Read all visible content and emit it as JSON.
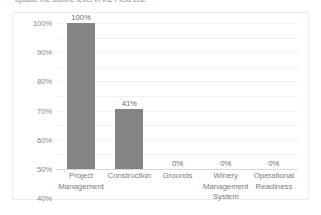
{
  "document": {
    "cropped_line": "update the outline level in the Field List."
  },
  "chart_data": {
    "type": "bar",
    "title": "",
    "xlabel": "",
    "ylabel": "",
    "categories": [
      "Project Management",
      "Construction",
      "Grounds",
      "Winery Management System",
      "Operational Readiness"
    ],
    "values": [
      100,
      41,
      0,
      0,
      0
    ],
    "data_labels": [
      "100%",
      "41%",
      "0%",
      "0%",
      "0%"
    ],
    "ylim": [
      0,
      100
    ],
    "ytick_values": [
      100,
      90,
      80,
      70,
      60,
      50,
      40,
      30,
      20,
      10,
      0
    ],
    "ytick_labels": [
      "100%",
      "90%",
      "80%",
      "70%",
      "60%",
      "50%",
      "40%",
      "30%",
      "20%",
      "10%",
      "0%"
    ],
    "grid": true,
    "legend": false,
    "colors": {
      "bar": "#848484",
      "gridline": "#f1f1f2",
      "axis": "#d9d9d9",
      "tick_text": "#878787",
      "category_text": "#7c7c7c",
      "data_label_text": "#6f6f6f",
      "plot_background": "#ffffff",
      "frame_border": "#ececed"
    }
  }
}
